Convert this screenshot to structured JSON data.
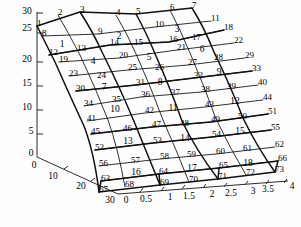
{
  "figure": {
    "kind": "3d-mesh-plot"
  },
  "chart_data": {
    "type": "scatter",
    "title": "",
    "xlabel": "",
    "ylabel": "",
    "zlabel": "",
    "grid": false,
    "legend": null,
    "axes": {
      "vertical": {
        "name": "z-axis",
        "ticks": [
          0,
          5,
          10,
          15,
          20,
          25,
          30
        ],
        "labels": [
          "0",
          "5",
          "10",
          "15",
          "20",
          "25",
          "30"
        ],
        "range": [
          0,
          30
        ]
      },
      "depth": {
        "name": "y-axis",
        "ticks": [
          0,
          10,
          20,
          30
        ],
        "labels": [
          "0",
          "10",
          "20",
          "30"
        ],
        "range": [
          0,
          30
        ]
      },
      "horizontal": {
        "name": "x-axis",
        "ticks": [
          0,
          0.5,
          1,
          1.5,
          2,
          2.5,
          3,
          3.5,
          4
        ],
        "labels": [
          "0",
          "0.5",
          "1",
          "1.5",
          "2",
          "2.5",
          "3",
          "3.5",
          "4"
        ],
        "range": [
          0,
          4
        ]
      }
    },
    "mesh": {
      "node_count": 73,
      "element_count": 18,
      "node_rows": 11,
      "node_cols": 7,
      "element_rows": 6,
      "element_cols": 3
    },
    "node_labels": [
      "1",
      "2",
      "3",
      "4",
      "5",
      "6",
      "7",
      "8",
      "9",
      "10",
      "11",
      "12",
      "13",
      "14",
      "15",
      "16",
      "17",
      "18",
      "19",
      "20",
      "21",
      "22",
      "23",
      "24",
      "25",
      "26",
      "27",
      "28",
      "29",
      "30",
      "31",
      "32",
      "33",
      "34",
      "35",
      "36",
      "37",
      "38",
      "39",
      "40",
      "41",
      "42",
      "43",
      "44",
      "45",
      "46",
      "47",
      "48",
      "49",
      "50",
      "51",
      "52",
      "53",
      "54",
      "55",
      "56",
      "57",
      "58",
      "59",
      "60",
      "61",
      "62",
      "63",
      "64",
      "65",
      "66",
      "67",
      "68",
      "69",
      "70",
      "71",
      "72",
      "73"
    ],
    "element_labels": [
      "1",
      "2",
      "3",
      "4",
      "5",
      "6",
      "7",
      "8",
      "9",
      "10",
      "11",
      "12",
      "13",
      "14",
      "15",
      "16",
      "17",
      "18"
    ]
  },
  "nodes": [
    {
      "id": "1",
      "x": 37,
      "y": 26
    },
    {
      "id": "2",
      "x": 58,
      "y": 15
    },
    {
      "id": "3",
      "x": 80,
      "y": 12
    },
    {
      "id": "4",
      "x": 116,
      "y": 15
    },
    {
      "id": "5",
      "x": 136,
      "y": 14
    },
    {
      "id": "6",
      "x": 170,
      "y": 10
    },
    {
      "id": "7",
      "x": 192,
      "y": 8
    },
    {
      "id": "8",
      "x": 42,
      "y": 36
    },
    {
      "id": "9",
      "x": 98,
      "y": 34
    },
    {
      "id": "10",
      "x": 155,
      "y": 27
    },
    {
      "id": "11",
      "x": 211,
      "y": 21
    },
    {
      "id": "12",
      "x": 49,
      "y": 55
    },
    {
      "id": "13",
      "x": 77,
      "y": 51
    },
    {
      "id": "14",
      "x": 110,
      "y": 45
    },
    {
      "id": "15",
      "x": 134,
      "y": 45
    },
    {
      "id": "16",
      "x": 169,
      "y": 42
    },
    {
      "id": "17",
      "x": 192,
      "y": 40
    },
    {
      "id": "18",
      "x": 224,
      "y": 30
    },
    {
      "id": "19",
      "x": 59,
      "y": 62
    },
    {
      "id": "20",
      "x": 119,
      "y": 58
    },
    {
      "id": "21",
      "x": 177,
      "y": 50
    },
    {
      "id": "22",
      "x": 234,
      "y": 43
    },
    {
      "id": "23",
      "x": 69,
      "y": 76
    },
    {
      "id": "24",
      "x": 97,
      "y": 78
    },
    {
      "id": "25",
      "x": 128,
      "y": 70
    },
    {
      "id": "26",
      "x": 155,
      "y": 70
    },
    {
      "id": "27",
      "x": 188,
      "y": 65
    },
    {
      "id": "28",
      "x": 214,
      "y": 60
    },
    {
      "id": "29",
      "x": 245,
      "y": 58
    },
    {
      "id": "30",
      "x": 76,
      "y": 91
    },
    {
      "id": "31",
      "x": 136,
      "y": 85
    },
    {
      "id": "32",
      "x": 194,
      "y": 78
    },
    {
      "id": "33",
      "x": 252,
      "y": 71
    },
    {
      "id": "34",
      "x": 84,
      "y": 106
    },
    {
      "id": "35",
      "x": 112,
      "y": 102
    },
    {
      "id": "36",
      "x": 141,
      "y": 97
    },
    {
      "id": "37",
      "x": 171,
      "y": 95
    },
    {
      "id": "38",
      "x": 201,
      "y": 92
    },
    {
      "id": "39",
      "x": 227,
      "y": 89
    },
    {
      "id": "40",
      "x": 258,
      "y": 85
    },
    {
      "id": "41",
      "x": 87,
      "y": 121
    },
    {
      "id": "42",
      "x": 145,
      "y": 113
    },
    {
      "id": "43",
      "x": 205,
      "y": 107
    },
    {
      "id": "44",
      "x": 263,
      "y": 100
    },
    {
      "id": "45",
      "x": 91,
      "y": 134
    },
    {
      "id": "46",
      "x": 123,
      "y": 131
    },
    {
      "id": "47",
      "x": 152,
      "y": 127
    },
    {
      "id": "48",
      "x": 180,
      "y": 126
    },
    {
      "id": "49",
      "x": 211,
      "y": 122
    },
    {
      "id": "50",
      "x": 238,
      "y": 119
    },
    {
      "id": "51",
      "x": 268,
      "y": 114
    },
    {
      "id": "52",
      "x": 95,
      "y": 150
    },
    {
      "id": "53",
      "x": 153,
      "y": 143
    },
    {
      "id": "54",
      "x": 212,
      "y": 137
    },
    {
      "id": "55",
      "x": 271,
      "y": 130
    },
    {
      "id": "56",
      "x": 99,
      "y": 166
    },
    {
      "id": "57",
      "x": 131,
      "y": 163
    },
    {
      "id": "58",
      "x": 160,
      "y": 159
    },
    {
      "id": "59",
      "x": 187,
      "y": 157
    },
    {
      "id": "60",
      "x": 216,
      "y": 154
    },
    {
      "id": "61",
      "x": 243,
      "y": 151
    },
    {
      "id": "62",
      "x": 275,
      "y": 147
    },
    {
      "id": "63",
      "x": 101,
      "y": 181
    },
    {
      "id": "64",
      "x": 159,
      "y": 174
    },
    {
      "id": "65",
      "x": 219,
      "y": 168
    },
    {
      "id": "66",
      "x": 278,
      "y": 161
    },
    {
      "id": "67",
      "x": 99,
      "y": 192
    },
    {
      "id": "68",
      "x": 125,
      "y": 187
    },
    {
      "id": "69",
      "x": 160,
      "y": 185
    },
    {
      "id": "70",
      "x": 189,
      "y": 182
    },
    {
      "id": "71",
      "x": 218,
      "y": 179
    },
    {
      "id": "72",
      "x": 246,
      "y": 175
    },
    {
      "id": "73",
      "x": 275,
      "y": 172
    }
  ],
  "elements": [
    {
      "id": "1",
      "x": 62,
      "y": 47
    },
    {
      "id": "2",
      "x": 119,
      "y": 39
    },
    {
      "id": "3",
      "x": 177,
      "y": 32
    },
    {
      "id": "4",
      "x": 93,
      "y": 64
    },
    {
      "id": "5",
      "x": 149,
      "y": 60
    },
    {
      "id": "6",
      "x": 202,
      "y": 52
    },
    {
      "id": "7",
      "x": 104,
      "y": 90
    },
    {
      "id": "8",
      "x": 160,
      "y": 85
    },
    {
      "id": "9",
      "x": 219,
      "y": 75
    },
    {
      "id": "10",
      "x": 115,
      "y": 112
    },
    {
      "id": "11",
      "x": 173,
      "y": 111
    },
    {
      "id": "12",
      "x": 235,
      "y": 104
    },
    {
      "id": "13",
      "x": 128,
      "y": 144
    },
    {
      "id": "14",
      "x": 185,
      "y": 141
    },
    {
      "id": "15",
      "x": 240,
      "y": 134
    },
    {
      "id": "16",
      "x": 136,
      "y": 175
    },
    {
      "id": "17",
      "x": 192,
      "y": 171
    },
    {
      "id": "18",
      "x": 248,
      "y": 166
    }
  ],
  "axis_tick_labels": {
    "vertical": [
      {
        "text": "30",
        "x": 27,
        "y": 14
      },
      {
        "text": "25",
        "x": 27,
        "y": 31
      },
      {
        "text": "20",
        "x": 27,
        "y": 62
      },
      {
        "text": "15",
        "x": 27,
        "y": 86
      },
      {
        "text": "10",
        "x": 27,
        "y": 110
      },
      {
        "text": "5",
        "x": 31,
        "y": 134
      },
      {
        "text": "0",
        "x": 31,
        "y": 156
      }
    ],
    "depth": [
      {
        "text": "0",
        "x": 34,
        "y": 168
      },
      {
        "text": "10",
        "x": 53,
        "y": 179
      },
      {
        "text": "20",
        "x": 81,
        "y": 189
      },
      {
        "text": "30",
        "x": 110,
        "y": 203
      }
    ],
    "horizontal": [
      {
        "text": "0",
        "x": 126,
        "y": 203
      },
      {
        "text": "0.5",
        "x": 146,
        "y": 202
      },
      {
        "text": "1",
        "x": 170,
        "y": 200
      },
      {
        "text": "1.5",
        "x": 189,
        "y": 199
      },
      {
        "text": "2",
        "x": 212,
        "y": 197
      },
      {
        "text": "2.5",
        "x": 231,
        "y": 196
      },
      {
        "text": "3",
        "x": 253,
        "y": 194
      },
      {
        "text": "3.5",
        "x": 268,
        "y": 192
      },
      {
        "text": "4",
        "x": 292,
        "y": 189
      }
    ]
  }
}
